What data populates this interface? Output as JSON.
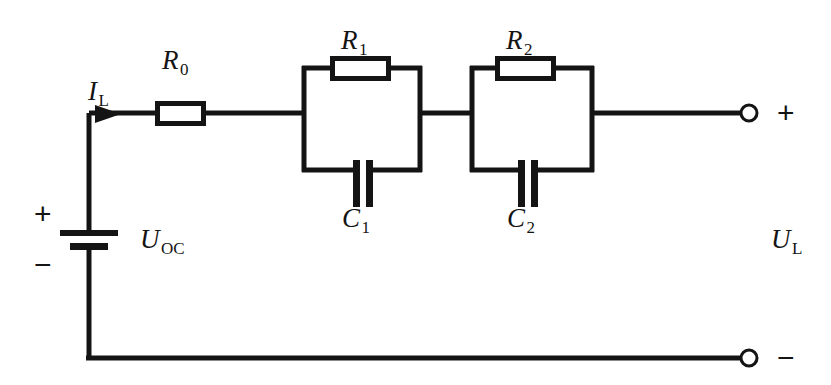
{
  "figure": {
    "width": 831,
    "height": 385,
    "background_color": "#ffffff",
    "wire_color": "#141414"
  },
  "labels": {
    "current_symbol": "I",
    "current_subscript": "L",
    "r0_symbol": "R",
    "r0_subscript": "0",
    "r1_symbol": "R",
    "r1_subscript": "1",
    "r2_symbol": "R",
    "r2_subscript": "2",
    "c1_symbol": "C",
    "c1_subscript": "1",
    "c2_symbol": "C",
    "c2_subscript": "2",
    "uoc_symbol": "U",
    "uoc_subscript": "OC",
    "ul_symbol": "U",
    "ul_subscript": "L",
    "source_plus": "+",
    "source_minus": "−",
    "terminal_plus": "+",
    "terminal_minus": "−"
  },
  "components": {
    "source": {
      "type": "dc-voltage-source",
      "name": "open-circuit-voltage-source"
    },
    "series_resistor": {
      "type": "resistor",
      "name": "ohmic-resistance"
    },
    "rc_branch_1": {
      "resistor": "resistor",
      "capacitor": "capacitor"
    },
    "rc_branch_2": {
      "resistor": "resistor",
      "capacitor": "capacitor"
    },
    "terminals": [
      {
        "name": "positive-output-terminal",
        "polarity": "+"
      },
      {
        "name": "negative-output-terminal",
        "polarity": "−"
      }
    ]
  }
}
